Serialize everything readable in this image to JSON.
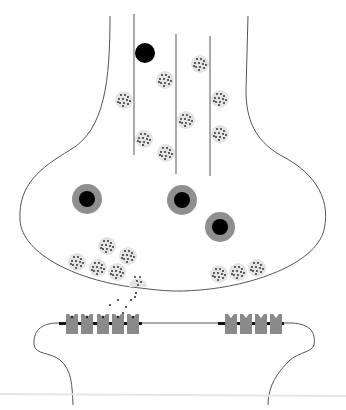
{
  "diagram": {
    "title": "",
    "colors": {
      "background": "#ffffff",
      "outline": "#555555",
      "vesicle_fill": "#e4e4e4",
      "neurotransmitter_dot": "#222222",
      "mitochondrion_outer": "#8f8f8f",
      "mitochondrion_inner": "#000000",
      "receptor_fill": "#8a8a8a",
      "channel_bar": "#111111",
      "baseline": "#e6e6e6"
    },
    "microtubules": [
      {
        "x": 134,
        "y1": 14,
        "y2": 155
      },
      {
        "x": 176,
        "y1": 34,
        "y2": 174
      },
      {
        "x": 210,
        "y1": 36,
        "y2": 176
      }
    ],
    "free_vesicle_dark": {
      "cx": 145,
      "cy": 53,
      "r": 10
    },
    "vesicles_axon": [
      {
        "cx": 124,
        "cy": 100
      },
      {
        "cx": 165,
        "cy": 80
      },
      {
        "cx": 200,
        "cy": 64
      },
      {
        "cx": 220,
        "cy": 99
      },
      {
        "cx": 144,
        "cy": 139
      },
      {
        "cx": 186,
        "cy": 120
      },
      {
        "cx": 166,
        "cy": 153
      },
      {
        "cx": 220,
        "cy": 134
      }
    ],
    "mitochondria": [
      {
        "cx": 87,
        "cy": 199
      },
      {
        "cx": 182,
        "cy": 200
      },
      {
        "cx": 220,
        "cy": 227
      }
    ],
    "vesicles_terminal": [
      {
        "cx": 107,
        "cy": 246
      },
      {
        "cx": 128,
        "cy": 256
      },
      {
        "cx": 77,
        "cy": 262
      },
      {
        "cx": 98,
        "cy": 268
      },
      {
        "cx": 117,
        "cy": 272
      },
      {
        "cx": 219,
        "cy": 274
      },
      {
        "cx": 238,
        "cy": 272
      },
      {
        "cx": 257,
        "cy": 268
      }
    ],
    "fusing_vesicle": {
      "cx": 138,
      "cy": 281
    },
    "released_neurotransmitters": [
      {
        "x": 136,
        "y": 293
      },
      {
        "x": 131,
        "y": 300
      },
      {
        "x": 118,
        "y": 300
      },
      {
        "x": 110,
        "y": 305
      },
      {
        "x": 126,
        "y": 307
      },
      {
        "x": 123,
        "y": 313
      },
      {
        "x": 135,
        "y": 297
      }
    ],
    "receptors_left": [
      {
        "x": 66,
        "bound": true
      },
      {
        "x": 81,
        "bound": true
      },
      {
        "x": 97,
        "bound": true
      },
      {
        "x": 112,
        "bound": true
      },
      {
        "x": 127,
        "bound": true
      }
    ],
    "receptors_right": [
      {
        "x": 225,
        "bound": false
      },
      {
        "x": 240,
        "bound": false
      },
      {
        "x": 255,
        "bound": false
      },
      {
        "x": 270,
        "bound": false
      }
    ],
    "labels": []
  }
}
